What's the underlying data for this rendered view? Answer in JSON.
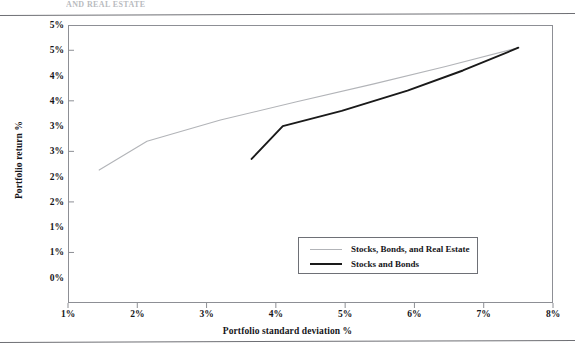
{
  "page": {
    "top_ghost_text": "AND REAL ESTATE"
  },
  "chart_data": {
    "type": "line",
    "title": "",
    "xlabel": "Portfolio standard deviation %",
    "ylabel": "Portfolio return %",
    "xlim": [
      1,
      8
    ],
    "ylim": [
      0,
      5.5
    ],
    "xticks": [
      1,
      2,
      3,
      4,
      5,
      6,
      7,
      8
    ],
    "xticklabels": [
      "1%",
      "2%",
      "3%",
      "4%",
      "5%",
      "6%",
      "7%",
      "8%"
    ],
    "yticks": [
      5.5,
      5.0,
      4.5,
      4.0,
      3.5,
      3.0,
      2.5,
      2.0,
      1.5,
      1.0,
      0.5,
      0.0
    ],
    "yticklabels": [
      "5%",
      "5%",
      "4%",
      "4%",
      "3%",
      "3%",
      "2%",
      "2%",
      "1%",
      "1%",
      "0%"
    ],
    "grid": false,
    "legend_position": "inside-bottom-right",
    "series": [
      {
        "name": "Stocks, Bonds, and Real Estate",
        "color": "#b2b4b8",
        "width": 1.1,
        "points": [
          [
            1.45,
            2.63
          ],
          [
            2.14,
            3.2
          ],
          [
            3.2,
            3.62
          ],
          [
            4.3,
            3.98
          ],
          [
            5.4,
            4.33
          ],
          [
            6.45,
            4.68
          ],
          [
            7.5,
            5.05
          ]
        ]
      },
      {
        "name": "Stocks and Bonds",
        "color": "#1a1a1a",
        "width": 1.9,
        "points": [
          [
            3.65,
            2.85
          ],
          [
            4.1,
            3.5
          ],
          [
            4.95,
            3.8
          ],
          [
            5.9,
            4.2
          ],
          [
            6.7,
            4.6
          ],
          [
            7.5,
            5.05
          ]
        ]
      }
    ],
    "legend": [
      {
        "label": "Stocks, Bonds, and Real Estate",
        "swatch": "gray"
      },
      {
        "label": "Stocks and Bonds",
        "swatch": "black"
      }
    ]
  }
}
